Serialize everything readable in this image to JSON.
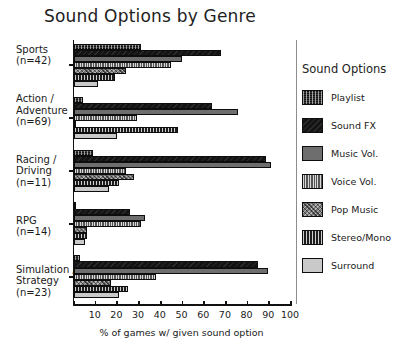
{
  "chart_data": {
    "type": "bar",
    "orientation": "horizontal",
    "title": "Sound Options by Genre",
    "xlabel": "% of games w/ given sound option",
    "ylabel": "",
    "xlim": [
      0,
      100
    ],
    "xticks": [
      10,
      20,
      30,
      40,
      50,
      60,
      70,
      80,
      90,
      100
    ],
    "grid": false,
    "legend_position": "right",
    "legend_title": "Sound Options",
    "categories": [
      {
        "name": "Sports",
        "n": "(n=42)",
        "lines": [
          "Sports",
          "(n=42)"
        ]
      },
      {
        "name": "Action / Adventure",
        "n": "(n=69)",
        "lines": [
          "Action /",
          "Adventure",
          "(n=69)"
        ]
      },
      {
        "name": "Racing / Driving",
        "n": "(n=11)",
        "lines": [
          "Racing /",
          "Driving",
          "(n=11)"
        ]
      },
      {
        "name": "RPG",
        "n": "(n=14)",
        "lines": [
          "RPG",
          "(n=14)"
        ]
      },
      {
        "name": "Simulation / Strategy",
        "n": "(n=23)",
        "lines": [
          "Simulation /",
          "Strategy",
          "(n=23)"
        ]
      }
    ],
    "series": [
      {
        "name": "Playlist",
        "pattern": "dark-speckle",
        "color": "#3a3a3a",
        "values": [
          31,
          4,
          9,
          1,
          3
        ]
      },
      {
        "name": "Sound FX",
        "pattern": "solid-black",
        "color": "#141414",
        "values": [
          68,
          64,
          89,
          26,
          85
        ]
      },
      {
        "name": "Music Vol.",
        "pattern": "solid-grey",
        "color": "#6e6e6e",
        "values": [
          50,
          76,
          91,
          33,
          90
        ]
      },
      {
        "name": "Voice Vol.",
        "pattern": "vertical-fine",
        "color": "#555555",
        "values": [
          45,
          29,
          24,
          31,
          38
        ]
      },
      {
        "name": "Pop Music",
        "pattern": "mottled-grey",
        "color": "#7b7b7b",
        "values": [
          24,
          1,
          28,
          6,
          17
        ]
      },
      {
        "name": "Stereo/Mono",
        "pattern": "dense-vertical",
        "color": "#1d1d1d",
        "values": [
          19,
          48,
          21,
          6,
          25
        ]
      },
      {
        "name": "Surround",
        "pattern": "light-grey",
        "color": "#c9c9c9",
        "values": [
          11,
          20,
          16,
          5,
          21
        ]
      }
    ]
  }
}
